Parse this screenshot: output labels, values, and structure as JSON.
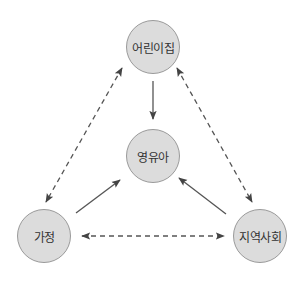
{
  "diagram": {
    "type": "relationship-diagram",
    "nodes": [
      {
        "id": "daycare",
        "label": "어린이집",
        "cx": 153,
        "cy": 47
      },
      {
        "id": "child",
        "label": "영유아",
        "cx": 153,
        "cy": 156
      },
      {
        "id": "family",
        "label": "가정",
        "cx": 44,
        "cy": 236
      },
      {
        "id": "community",
        "label": "지역사회",
        "cx": 260,
        "cy": 236
      }
    ],
    "edges": [
      {
        "from": "daycare",
        "to": "child",
        "style": "solid",
        "direction": "one-way"
      },
      {
        "from": "family",
        "to": "child",
        "style": "solid",
        "direction": "one-way"
      },
      {
        "from": "community",
        "to": "child",
        "style": "solid",
        "direction": "one-way"
      },
      {
        "from": "daycare",
        "to": "family",
        "style": "dashed",
        "direction": "two-way"
      },
      {
        "from": "daycare",
        "to": "community",
        "style": "dashed",
        "direction": "two-way"
      },
      {
        "from": "family",
        "to": "community",
        "style": "dashed",
        "direction": "two-way"
      }
    ],
    "colors": {
      "node_fill": "#dcdcdc",
      "node_stroke": "#9a9a9a",
      "text": "#333333",
      "arrow": "#444444"
    }
  }
}
